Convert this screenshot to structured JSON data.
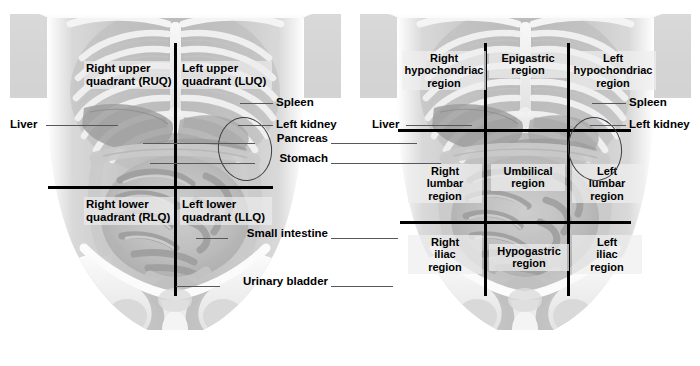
{
  "figure": {
    "background": "#ffffff",
    "line_color": "#000000",
    "leader_color": "#55585c"
  },
  "panels": [
    {
      "id": "quadrants",
      "name": "Abdominopelvic quadrants",
      "scheme": "four-quadrant",
      "labels": [
        {
          "key": "ruq",
          "text": "Right upper\nquadrant (RUQ)"
        },
        {
          "key": "luq",
          "text": "Left upper\nquadrant (LUQ)"
        },
        {
          "key": "rlq",
          "text": "Right lower\nquadrant (RLQ)"
        },
        {
          "key": "llq",
          "text": "Left lower\nquadrant (LLQ)"
        }
      ]
    },
    {
      "id": "regions",
      "name": "Abdominopelvic regions",
      "scheme": "nine-region",
      "labels": [
        {
          "key": "right-hypochondriac",
          "text": "Right\nhypochondriac\nregion"
        },
        {
          "key": "epigastric",
          "text": "Epigastric\nregion"
        },
        {
          "key": "left-hypochondriac",
          "text": "Left\nhypochondriac\nregion"
        },
        {
          "key": "right-lumbar",
          "text": "Right\nlumbar\nregion"
        },
        {
          "key": "umbilical",
          "text": "Umbilical\nregion"
        },
        {
          "key": "left-lumbar",
          "text": "Left\nlumbar\nregion"
        },
        {
          "key": "right-iliac",
          "text": "Right\niliac\nregion"
        },
        {
          "key": "hypogastric",
          "text": "Hypogastric\nregion"
        },
        {
          "key": "left-iliac",
          "text": "Left\niliac\nregion"
        }
      ]
    }
  ],
  "organ_labels": {
    "liver_left": "Liver",
    "liver_right": "Liver",
    "spleen_left": "Spleen",
    "spleen_right": "Spleen",
    "left_kidney_left": "Left kidney",
    "left_kidney_right": "Left kidney",
    "pancreas": "Pancreas",
    "stomach": "Stomach",
    "small_intestine": "Small intestine",
    "urinary_bladder": "Urinary bladder"
  }
}
